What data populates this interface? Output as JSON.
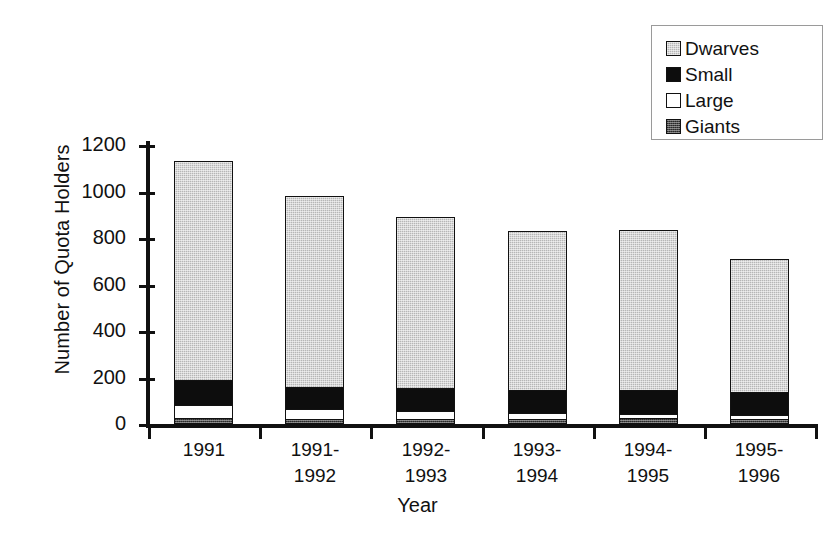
{
  "chart_data": {
    "type": "bar",
    "stacked": true,
    "title": "",
    "xlabel": "Year",
    "ylabel": "Number of Quota Holders",
    "categories": [
      "1991",
      "1991-\n1992",
      "1992-\n1993",
      "1993-\n1994",
      "1994-\n1995",
      "1995-\n1996"
    ],
    "category_lines": [
      [
        "1991"
      ],
      [
        "1991-",
        "1992"
      ],
      [
        "1992-",
        "1993"
      ],
      [
        "1993-",
        "1994"
      ],
      [
        "1994-",
        "1995"
      ],
      [
        "1995-",
        "1996"
      ]
    ],
    "ylim": [
      0,
      1200
    ],
    "yticks": [
      0,
      200,
      400,
      600,
      800,
      1000,
      1200
    ],
    "ytick_labels": [
      "0",
      "200",
      "400",
      "600",
      "800",
      "1000",
      "1200"
    ],
    "grid": false,
    "legend_position": "top-right",
    "stack_order_bottom_to_top": [
      "Giants",
      "Large",
      "Small",
      "Dwarves"
    ],
    "series": [
      {
        "name": "Dwarves",
        "color": "#b6b6b6",
        "pattern": "light-dither",
        "values": [
          945,
          825,
          740,
          690,
          695,
          580
        ]
      },
      {
        "name": "Small",
        "color": "#0d0d0d",
        "pattern": "solid-black",
        "values": [
          115,
          105,
          105,
          105,
          110,
          105
        ]
      },
      {
        "name": "Large",
        "color": "#ffffff",
        "pattern": "white",
        "values": [
          65,
          50,
          45,
          35,
          25,
          25
        ]
      },
      {
        "name": "Giants",
        "color": "#4a4a4a",
        "pattern": "dark-dither",
        "values": [
          25,
          20,
          20,
          20,
          25,
          20
        ]
      }
    ],
    "totals": [
      1150,
      1000,
      910,
      850,
      855,
      730
    ]
  },
  "legend": {
    "items": [
      {
        "label": "Dwarves",
        "swatch": "legend-swatch-dwarves"
      },
      {
        "label": "Small",
        "swatch": "legend-swatch-small"
      },
      {
        "label": "Large",
        "swatch": "legend-swatch-large"
      },
      {
        "label": "Giants",
        "swatch": "legend-swatch-giants"
      }
    ]
  },
  "axes": {
    "y_title": "Number of Quota Holders",
    "x_title": "Year"
  },
  "colors": {
    "axis": "#111111",
    "dwarves": "#b6b6b6",
    "small": "#0d0d0d",
    "large": "#ffffff",
    "giants": "#4a4a4a"
  }
}
